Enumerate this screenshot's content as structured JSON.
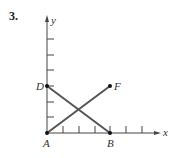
{
  "problem_number": "3.",
  "axes": {
    "x_label": "x",
    "y_label": "y",
    "x_ticks": 6,
    "y_ticks": 6
  },
  "points": [
    {
      "name": "A",
      "x": 0,
      "y": 0
    },
    {
      "name": "B",
      "x": 4,
      "y": 0
    },
    {
      "name": "D",
      "x": 0,
      "y": 4
    },
    {
      "name": "F",
      "x": 4,
      "y": 4
    }
  ],
  "segments": [
    {
      "from": "D",
      "to": "B"
    },
    {
      "from": "A",
      "to": "F"
    }
  ],
  "colors": {
    "segment": "#555555",
    "axis": "#444444",
    "point": "#111111"
  }
}
